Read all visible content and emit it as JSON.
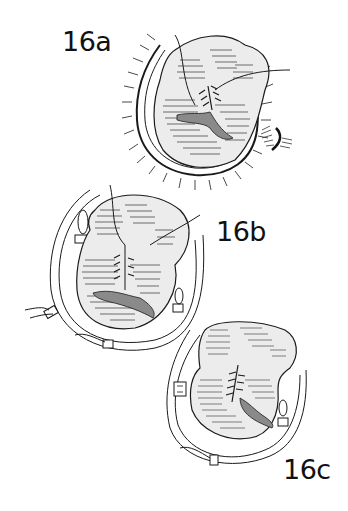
{
  "figure": {
    "panels": [
      {
        "id": "16a",
        "label": "16a",
        "description": "heart valve view with sutures, surrounded by retracted tissue"
      },
      {
        "id": "16b",
        "label": "16b",
        "description": "valve with looped sutures and pledgets around annulus"
      },
      {
        "id": "16c",
        "label": "16c",
        "description": "valve with completed suture line and pledgets"
      }
    ],
    "colors": {
      "line": "#1a1a1a",
      "tissue_fill": "#e6e6e6",
      "shadow_fill": "#8a8a8a",
      "background": "#ffffff"
    }
  }
}
